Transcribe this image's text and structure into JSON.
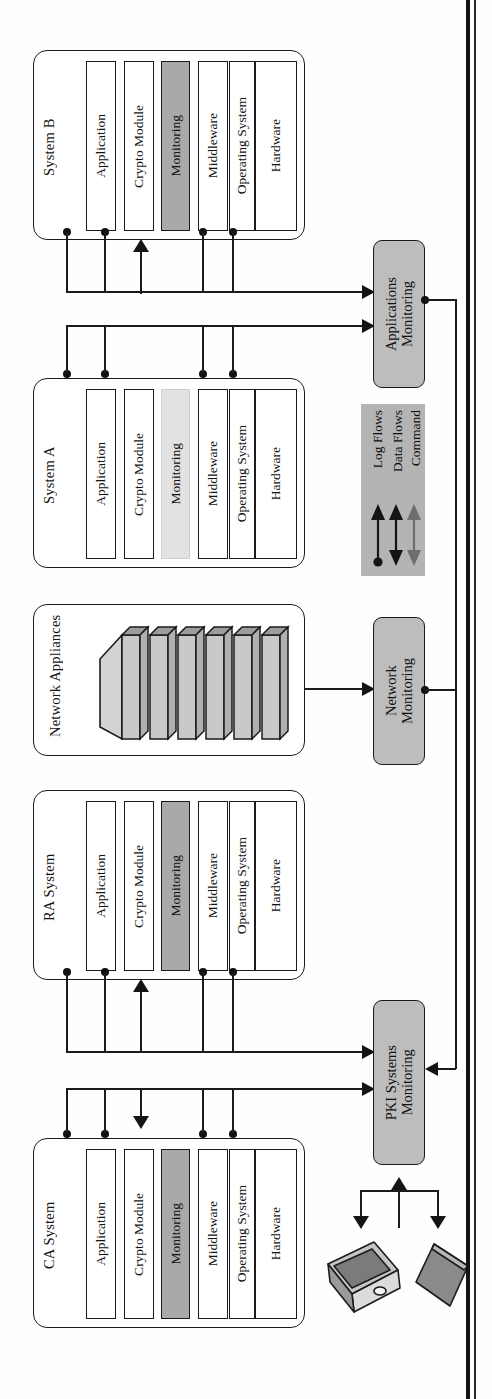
{
  "diagram": {
    "orientation": "rotated-90-ccw",
    "colors": {
      "monitoring_highlight": "#a9a9a9",
      "monitoring_highlight_light": "#e2e2e2",
      "monitoring_box_fill": "#bdbdbd",
      "legend_fill": "#b4b4b4",
      "line": "#1b1b1b",
      "command_arrow": "#6e6e6e"
    }
  },
  "systems": [
    {
      "id": "system-b",
      "title": "System B",
      "layers": [
        {
          "label": "Application",
          "style": "plain"
        },
        {
          "label": "Crypto Module",
          "style": "plain"
        },
        {
          "label": "Monitoring",
          "style": "dark"
        },
        {
          "label": "Middleware",
          "style": "plain"
        },
        {
          "label": "Operating System",
          "style": "plain"
        },
        {
          "label": "Hardware",
          "style": "plain"
        }
      ]
    },
    {
      "id": "system-a",
      "title": "System A",
      "layers": [
        {
          "label": "Application",
          "style": "plain"
        },
        {
          "label": "Crypto Module",
          "style": "plain"
        },
        {
          "label": "Monitoring",
          "style": "light"
        },
        {
          "label": "Middleware",
          "style": "plain"
        },
        {
          "label": "Operating System",
          "style": "plain"
        },
        {
          "label": "Hardware",
          "style": "plain"
        }
      ]
    },
    {
      "id": "network-appliances",
      "title": "Network Appliances",
      "appliance_count": 6,
      "layers": []
    },
    {
      "id": "ra-system",
      "title": "RA System",
      "layers": [
        {
          "label": "Application",
          "style": "plain"
        },
        {
          "label": "Crypto Module",
          "style": "plain"
        },
        {
          "label": "Monitoring",
          "style": "dark"
        },
        {
          "label": "Middleware",
          "style": "plain"
        },
        {
          "label": "Operating System",
          "style": "plain"
        },
        {
          "label": "Hardware",
          "style": "plain"
        }
      ]
    },
    {
      "id": "ca-system",
      "title": "CA System",
      "layers": [
        {
          "label": "Application",
          "style": "plain"
        },
        {
          "label": "Crypto Module",
          "style": "plain"
        },
        {
          "label": "Monitoring",
          "style": "dark"
        },
        {
          "label": "Middleware",
          "style": "plain"
        },
        {
          "label": "Operating System",
          "style": "plain"
        },
        {
          "label": "Hardware",
          "style": "plain"
        }
      ]
    }
  ],
  "monitors": [
    {
      "id": "applications-monitoring",
      "label": "Applications\nMonitoring",
      "line1": "Applications",
      "line2": "Monitoring"
    },
    {
      "id": "network-monitoring",
      "label": "Network\nMonitoring",
      "line1": "Network",
      "line2": "Monitoring"
    },
    {
      "id": "pki-systems-monitoring",
      "label": "PKI Systems\nMonitoring",
      "line1": "PKI Systems",
      "line2": "Monitoring"
    }
  ],
  "legend": {
    "id": "flow-legend",
    "items": [
      {
        "label": "Log Flows",
        "arrow": "single-up-with-source-dot",
        "color": "#141414"
      },
      {
        "label": "Data Flows",
        "arrow": "double-headed",
        "color": "#141414"
      },
      {
        "label": "Command",
        "arrow": "double-headed",
        "color": "#6e6e6e"
      }
    ]
  },
  "devices": [
    {
      "id": "operator-workstation",
      "kind": "computer-icon"
    },
    {
      "id": "operator-console",
      "kind": "panel-icon"
    }
  ]
}
